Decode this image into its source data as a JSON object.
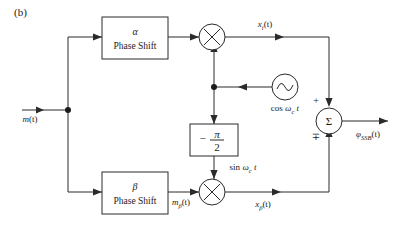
{
  "figure": {
    "panel_label": "(b)",
    "caption": ""
  },
  "colors": {
    "line": "#2b2b2b",
    "text": "#1b1b1b",
    "background": "#ffffff"
  },
  "blocks": [
    {
      "id": "alpha-phase-shift",
      "symbol": "α",
      "label": "Phase Shift"
    },
    {
      "id": "beta-phase-shift",
      "symbol": "β",
      "label": "Phase Shift"
    },
    {
      "id": "quadrature-phase-shift",
      "minus": "−",
      "numerator": "π",
      "denominator": "2"
    }
  ],
  "operators": {
    "multiplier_symbol": "✕",
    "summer_symbol": "Σ",
    "summer_sign_top": "+",
    "summer_sign_bottom": "∓"
  },
  "oscillator": {
    "label": "cos ω",
    "label_sub": "c",
    "label_tail": "t",
    "waveform": "sine-wave"
  },
  "signals": {
    "input": "m(t)",
    "input_name": "m",
    "hilbert": "m",
    "hilbert_sub": "β",
    "upper_mixer_out": "x",
    "upper_mixer_out_sub": "i",
    "lower_mixer_out": "x",
    "lower_mixer_out_sub": "β",
    "quadrature_carrier": "sin ω",
    "quadrature_carrier_sub": "c",
    "quadrature_carrier_tail": "t",
    "output": "φ",
    "output_sub": "SSB",
    "paren_t": "(t)"
  },
  "labels": {
    "m_of_t": "m(t)",
    "m_beta_of_t": "mβ(t)",
    "x_i_of_t": "xi(t)",
    "x_beta_of_t": "xβ(t)",
    "cos_wc_t": "cos ωc t",
    "sin_wc_t": "sin ωc t",
    "phi_ssb_of_t": "φSSB(t)"
  }
}
